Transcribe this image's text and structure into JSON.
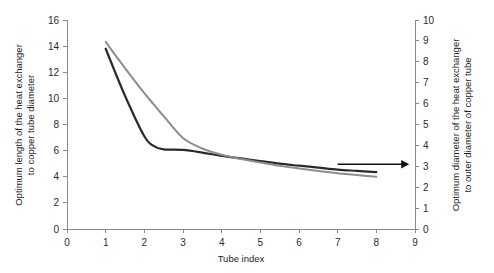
{
  "chart_data": {
    "type": "line",
    "title": "",
    "xlabel": "Tube index",
    "ylabel": "Optimum length of the heat exchanger to copper tube diameter",
    "y2label": "Optimum diameter of the heat exchanger to outer diameter of copper tube",
    "xlim": [
      0,
      9
    ],
    "ylim": [
      0,
      16
    ],
    "y2lim": [
      0,
      10
    ],
    "xticks": [
      0,
      1,
      2,
      3,
      4,
      5,
      6,
      7,
      8,
      9
    ],
    "yticks": [
      0,
      2,
      4,
      6,
      8,
      10,
      12,
      14,
      16
    ],
    "y2ticks": [
      0,
      1,
      2,
      3,
      4,
      5,
      6,
      7,
      8,
      9,
      10
    ],
    "grid": false,
    "legend": "none",
    "x": [
      1,
      1.5,
      2,
      2.25,
      2.5,
      3,
      3.5,
      4,
      4.5,
      5,
      5.5,
      6,
      6.5,
      7,
      7.5,
      8
    ],
    "series": [
      {
        "name": "Optimum length of the heat exchanger to copper tube diameter",
        "axis": "left",
        "color": "#2a2a2a",
        "width": 2.2,
        "values": [
          13.8,
          10.2,
          7.1,
          6.35,
          6.1,
          6.05,
          5.85,
          5.6,
          5.4,
          5.2,
          5.0,
          4.85,
          4.7,
          4.55,
          4.45,
          4.35
        ]
      },
      {
        "name": "Optimum diameter of the heat exchanger to outer diameter of copper tube",
        "axis": "right",
        "color": "#8d8d8d",
        "width": 2.0,
        "values": [
          8.95,
          7.7,
          6.5,
          5.95,
          5.4,
          4.35,
          3.85,
          3.55,
          3.35,
          3.18,
          3.02,
          2.9,
          2.78,
          2.67,
          2.58,
          2.5
        ]
      }
    ],
    "annotations": [
      {
        "name": "right-arrow-to-secondary-axis",
        "type": "arrow",
        "x_start": 7.0,
        "x_end": 8.85,
        "y_right_axis": 3.1,
        "color": "#111111"
      }
    ]
  }
}
